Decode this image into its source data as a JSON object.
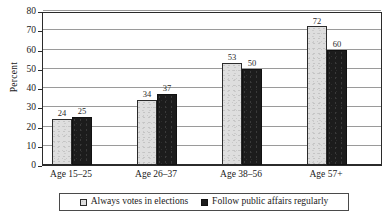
{
  "chart_data": {
    "type": "bar",
    "title": "",
    "xlabel": "",
    "ylabel": "Percent",
    "ylim": [
      0,
      80
    ],
    "ytick_step": 10,
    "yticks": [
      0,
      10,
      20,
      30,
      40,
      50,
      60,
      70,
      80
    ],
    "ytick_labels": [
      "0",
      "10",
      "20",
      "30",
      "40",
      "50",
      "60",
      "70",
      "80"
    ],
    "grid": true,
    "grid_axis": "y",
    "legend_position": "bottom",
    "categories": [
      "Age 15–25",
      "Age 26–37",
      "Age 38–56",
      "Age 57+"
    ],
    "series": [
      {
        "name": "Always votes in elections",
        "values": [
          24,
          34,
          53,
          72
        ],
        "value_labels": [
          "24",
          "34",
          "53",
          "72"
        ],
        "color": "#dedede",
        "edge_color": "#2b2b2b"
      },
      {
        "name": "Follow public affairs regularly",
        "values": [
          25,
          37,
          50,
          60
        ],
        "value_labels": [
          "25",
          "37",
          "50",
          "60"
        ],
        "color": "#1c1c1c",
        "edge_color": "#111111"
      }
    ]
  },
  "legend": {
    "items": [
      {
        "label": "Always votes in elections",
        "swatch": "light"
      },
      {
        "label": "Follow public affairs regularly",
        "swatch": "dark"
      }
    ]
  }
}
